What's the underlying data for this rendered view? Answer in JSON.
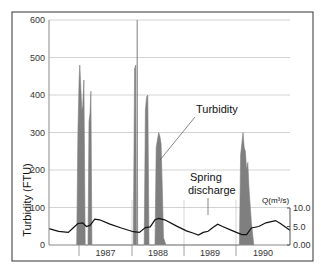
{
  "chart_data": {
    "type": "area",
    "title": "",
    "xlabel": "",
    "ylabel": "Turbidity (FTU)",
    "y2label": "Q(m³/s)",
    "ylim": [
      0,
      600
    ],
    "y2lim": [
      0,
      10
    ],
    "yticks": [
      0,
      100,
      200,
      300,
      400,
      500,
      600
    ],
    "y2ticks": [
      "0.00",
      "5.0",
      "10.0"
    ],
    "grid": true,
    "x_categories": [
      "1987",
      "1988",
      "1989",
      "1990"
    ],
    "annotations": [
      {
        "text": "Turbidity",
        "target": "turbidity peaks 1988"
      },
      {
        "text": "Spring discharge",
        "target": "discharge line 1989"
      }
    ],
    "series": [
      {
        "name": "Turbidity",
        "axis": "left",
        "unit": "FTU",
        "style": "filled spikes",
        "color": "#7f7f7f",
        "points": [
          [
            0.115,
            0
          ],
          [
            0.12,
            300
          ],
          [
            0.125,
            440
          ],
          [
            0.128,
            480
          ],
          [
            0.132,
            420
          ],
          [
            0.136,
            360
          ],
          [
            0.14,
            370
          ],
          [
            0.145,
            440
          ],
          [
            0.15,
            0
          ],
          [
            0.162,
            0
          ],
          [
            0.166,
            330
          ],
          [
            0.17,
            350
          ],
          [
            0.174,
            410
          ],
          [
            0.178,
            0
          ],
          [
            0.35,
            0
          ],
          [
            0.355,
            470
          ],
          [
            0.36,
            480
          ],
          [
            0.362,
            0
          ],
          [
            0.364,
            0
          ],
          [
            0.366,
            600
          ],
          [
            0.368,
            0
          ],
          [
            0.395,
            0
          ],
          [
            0.4,
            360
          ],
          [
            0.405,
            395
          ],
          [
            0.41,
            400
          ],
          [
            0.415,
            0
          ],
          [
            0.44,
            0
          ],
          [
            0.445,
            260
          ],
          [
            0.45,
            280
          ],
          [
            0.455,
            300
          ],
          [
            0.46,
            290
          ],
          [
            0.465,
            270
          ],
          [
            0.47,
            150
          ],
          [
            0.475,
            20
          ],
          [
            0.485,
            0
          ],
          [
            0.79,
            0
          ],
          [
            0.795,
            240
          ],
          [
            0.8,
            270
          ],
          [
            0.805,
            300
          ],
          [
            0.81,
            260
          ],
          [
            0.815,
            250
          ],
          [
            0.82,
            200
          ],
          [
            0.825,
            220
          ],
          [
            0.83,
            150
          ],
          [
            0.84,
            60
          ],
          [
            0.85,
            0
          ]
        ]
      },
      {
        "name": "Spring discharge",
        "axis": "right",
        "unit": "m³/s",
        "style": "line",
        "color": "#111111",
        "points": [
          [
            0.0,
            4.4
          ],
          [
            0.04,
            3.7
          ],
          [
            0.08,
            3.4
          ],
          [
            0.1,
            4.6
          ],
          [
            0.12,
            5.8
          ],
          [
            0.14,
            6.0
          ],
          [
            0.155,
            5.0
          ],
          [
            0.17,
            5.3
          ],
          [
            0.19,
            7.0
          ],
          [
            0.21,
            6.8
          ],
          [
            0.25,
            5.7
          ],
          [
            0.3,
            4.6
          ],
          [
            0.35,
            3.6
          ],
          [
            0.375,
            3.4
          ],
          [
            0.4,
            4.7
          ],
          [
            0.42,
            4.9
          ],
          [
            0.44,
            6.8
          ],
          [
            0.455,
            7.2
          ],
          [
            0.48,
            6.8
          ],
          [
            0.53,
            5.1
          ],
          [
            0.57,
            3.8
          ],
          [
            0.6,
            3.2
          ],
          [
            0.62,
            2.7
          ],
          [
            0.64,
            3.4
          ],
          [
            0.66,
            3.7
          ],
          [
            0.68,
            4.7
          ],
          [
            0.7,
            5.6
          ],
          [
            0.72,
            5.0
          ],
          [
            0.76,
            3.9
          ],
          [
            0.8,
            2.8
          ],
          [
            0.82,
            2.8
          ],
          [
            0.84,
            4.6
          ],
          [
            0.87,
            5.0
          ],
          [
            0.9,
            6.0
          ],
          [
            0.94,
            6.6
          ],
          [
            0.96,
            5.8
          ],
          [
            1.0,
            4.0
          ]
        ]
      }
    ]
  },
  "labels": {
    "ylabel": "Turbidity (FTU)",
    "y2label": "Q(m³/s)",
    "annot_turbidity": "Turbidity",
    "annot_spring_1": "Spring",
    "annot_spring_2": "discharge"
  }
}
